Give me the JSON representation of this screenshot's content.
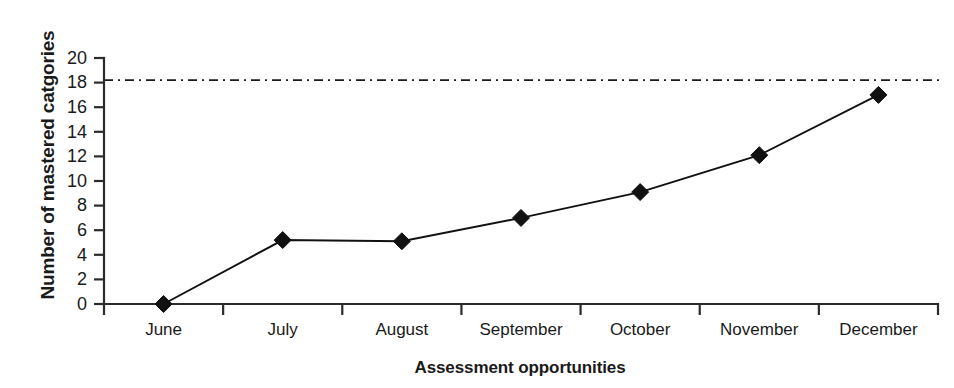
{
  "chart_data": {
    "type": "line",
    "title": "",
    "xlabel": "Assessment opportunities",
    "ylabel": "Number of mastered catgories",
    "categories": [
      "June",
      "July",
      "August",
      "September",
      "October",
      "November",
      "December"
    ],
    "series": [
      {
        "name": "Mastered categories",
        "values": [
          0,
          5.2,
          5.1,
          7.0,
          9.1,
          12.1,
          17.0
        ],
        "marker": "diamond",
        "marker_color": "#111111",
        "line_color": "#111111"
      }
    ],
    "ylim": [
      0,
      20
    ],
    "yticks": [
      0,
      2,
      4,
      6,
      8,
      10,
      12,
      14,
      16,
      18,
      20
    ],
    "ytick_labels": [
      "0",
      "2",
      "4",
      "6",
      "8",
      "10",
      "12",
      "14",
      "16",
      "18",
      "20"
    ],
    "grid": false,
    "legend": false,
    "annotations": [
      {
        "type": "reference-line",
        "orientation": "horizontal",
        "value": 18.2,
        "style": "dash-dot",
        "color": "#1a1a1a",
        "label": ""
      }
    ]
  },
  "axes": {
    "y_title": "Number of mastered catgories",
    "x_title": "Assessment opportunities"
  },
  "colors": {
    "background": "#ffffff",
    "ink": "#1a1a1a",
    "axis": "#2b2b2b",
    "series": "#111111"
  }
}
